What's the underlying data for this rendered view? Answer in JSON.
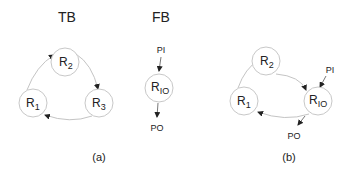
{
  "panel_a": {
    "caption": "(a)",
    "tb": {
      "title": "TB",
      "nodes": [
        {
          "id": "R1",
          "base": "R",
          "sub": "1"
        },
        {
          "id": "R2",
          "base": "R",
          "sub": "2"
        },
        {
          "id": "R3",
          "base": "R",
          "sub": "3"
        }
      ],
      "edges": [
        {
          "from": "R1",
          "to": "R2"
        },
        {
          "from": "R2",
          "to": "R3"
        },
        {
          "from": "R3",
          "to": "R1"
        }
      ]
    },
    "fb": {
      "title": "FB",
      "node": {
        "id": "RIO",
        "base": "R",
        "sub": "IO"
      },
      "input_label": "PI",
      "output_label": "PO"
    }
  },
  "panel_b": {
    "caption": "(b)",
    "nodes": [
      {
        "id": "R1",
        "base": "R",
        "sub": "1"
      },
      {
        "id": "R2",
        "base": "R",
        "sub": "2"
      },
      {
        "id": "RIO",
        "base": "R",
        "sub": "IO"
      }
    ],
    "edges": [
      {
        "from": "R1",
        "to": "R2"
      },
      {
        "from": "R2",
        "to": "RIO"
      },
      {
        "from": "RIO",
        "to": "R1"
      }
    ],
    "input_label": "PI",
    "output_label": "PO"
  },
  "colors": {
    "node_stroke": "#c8c8c8",
    "edge_stroke": "#c4c4c4",
    "arrowhead": "#222222",
    "text": "#222222"
  }
}
